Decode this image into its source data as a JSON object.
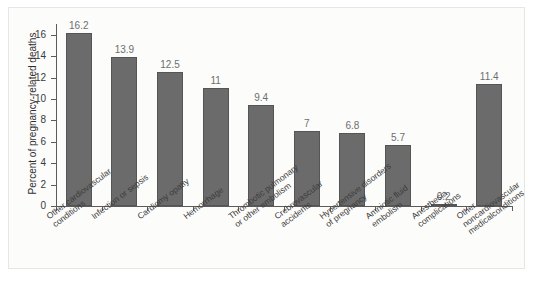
{
  "chart_data": {
    "type": "bar",
    "title": "",
    "subtitle": "",
    "xlabel": "",
    "ylabel": "Percent of pregnancy-related deaths",
    "ylim": [
      0,
      17
    ],
    "yticks": [
      0,
      2,
      4,
      6,
      8,
      10,
      12,
      14,
      16
    ],
    "ytick_labels": [
      "0",
      "2",
      "4",
      "6",
      "8",
      "10",
      "12",
      "14",
      "16"
    ],
    "grid": false,
    "legend": null,
    "categories": [
      "Other cardiovascular\nconditions",
      "Infection or sepsis",
      "Cardiomy opatty",
      "Hemorrhage",
      "Thrombotic pulmonary\nor other embolism",
      "Crebrovascular\naccidents",
      "Hypertensive disorders\nof pregnancy",
      "Amniotic fluid\nembolism",
      "Anesthesia\ncomplications",
      "Other noncardiovascular\nmedicalconditions"
    ],
    "values": [
      16.2,
      13.9,
      12.5,
      11,
      9.4,
      7,
      6.8,
      5.7,
      0.2,
      11.4
    ],
    "value_labels": [
      "16.2",
      "13.9",
      "12.5",
      "11",
      "9.4",
      "7",
      "6.8",
      "5.7",
      "0.2",
      "11.4"
    ],
    "bar_color": "#6b6b6b",
    "bar_edge_color": "#555555",
    "axis_color": "#5b5b5b",
    "value_label_color": "#6e6e6e",
    "background_color": "#fcfcfb"
  }
}
